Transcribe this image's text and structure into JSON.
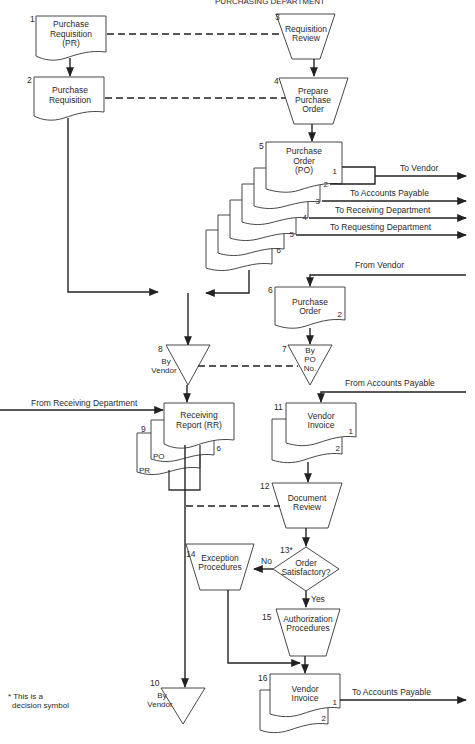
{
  "header": {
    "title": "PURCHASING DEPARTMENT"
  },
  "nodes": {
    "n1": {
      "num": "1",
      "lines": [
        "Purchase",
        "Requisition",
        "(PR)"
      ]
    },
    "n2": {
      "num": "2",
      "lines": [
        "Purchase",
        "Requisition"
      ]
    },
    "n3": {
      "num": "3",
      "lines": [
        "Requisition",
        "Review"
      ]
    },
    "n4": {
      "num": "4",
      "lines": [
        "Prepare",
        "Purchase",
        "Order"
      ]
    },
    "n5": {
      "num": "5",
      "lines": [
        "Purchase",
        "Order",
        "(PO)"
      ],
      "copies": [
        "1",
        "2",
        "3",
        "4",
        "5",
        "6"
      ]
    },
    "n6": {
      "num": "6",
      "lines": [
        "Purchase",
        "Order"
      ],
      "copy": "2"
    },
    "n7": {
      "num": "7",
      "lines": [
        "By",
        "PO",
        "No."
      ]
    },
    "n8": {
      "num": "8",
      "lines": [
        "By",
        "Vendor"
      ]
    },
    "n9": {
      "num": "9",
      "lines": [
        "Receiving",
        "Report (RR)"
      ],
      "copies": [
        "6",
        "PO",
        "PR"
      ]
    },
    "n10": {
      "num": "10",
      "lines": [
        "By",
        "Vendor"
      ]
    },
    "n11": {
      "num": "11",
      "lines": [
        "Vendor",
        "Invoice"
      ],
      "copies": [
        "1",
        "2"
      ]
    },
    "n12": {
      "num": "12",
      "lines": [
        "Document",
        "Review"
      ]
    },
    "n13": {
      "num": "13*",
      "lines": [
        "Order",
        "Satisfactory?"
      ]
    },
    "n14": {
      "num": "14",
      "lines": [
        "Exception",
        "Procedures"
      ]
    },
    "n15": {
      "num": "15",
      "lines": [
        "Authorization",
        "Procedures"
      ]
    },
    "n16": {
      "num": "16",
      "lines": [
        "Vendor",
        "Invoice"
      ],
      "copies": [
        "1",
        "2"
      ]
    }
  },
  "flows": {
    "to_vendor": "To Vendor",
    "to_accounts_payable": "To Accounts Payable",
    "to_receiving": "To Receiving Department",
    "to_requesting": "To Requesting Department",
    "from_vendor": "From Vendor",
    "from_accounts_payable": "From Accounts Payable",
    "from_receiving": "From Receiving Department",
    "decision_no": "No",
    "decision_yes": "Yes",
    "to_accounts_payable_final": "To Accounts Payable"
  },
  "footnote": {
    "line1": "* This is a",
    "line2": "decision symbol"
  }
}
